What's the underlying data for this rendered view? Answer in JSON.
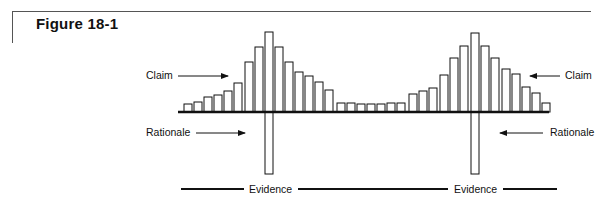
{
  "figure": {
    "title": "Figure 18-1"
  },
  "labels": {
    "claim_left": "Claim",
    "claim_right": "Claim",
    "rationale_left": "Rationale",
    "rationale_right": "Rationale",
    "evidence_left": "Evidence",
    "evidence_right": "Evidence"
  },
  "colors": {
    "stroke": "#111111",
    "frame": "#555555",
    "background": "#ffffff"
  },
  "diagram": {
    "baseline_y": 112,
    "bar_width": 8,
    "claim_bars": [
      {
        "x": 184,
        "top": 104
      },
      {
        "x": 194,
        "top": 102
      },
      {
        "x": 204,
        "top": 97
      },
      {
        "x": 214,
        "top": 95
      },
      {
        "x": 224,
        "top": 91
      },
      {
        "x": 234,
        "top": 83
      },
      {
        "x": 245,
        "top": 62
      },
      {
        "x": 255,
        "top": 47
      },
      {
        "x": 265,
        "top": 32
      },
      {
        "x": 275,
        "top": 47
      },
      {
        "x": 285,
        "top": 62
      },
      {
        "x": 295,
        "top": 72
      },
      {
        "x": 305,
        "top": 76
      },
      {
        "x": 315,
        "top": 82
      },
      {
        "x": 325,
        "top": 90
      },
      {
        "x": 337,
        "top": 103
      },
      {
        "x": 347,
        "top": 103
      },
      {
        "x": 357,
        "top": 104
      },
      {
        "x": 367,
        "top": 104
      },
      {
        "x": 377,
        "top": 104
      },
      {
        "x": 387,
        "top": 103
      },
      {
        "x": 397,
        "top": 103
      },
      {
        "x": 409,
        "top": 94
      },
      {
        "x": 419,
        "top": 91
      },
      {
        "x": 429,
        "top": 88
      },
      {
        "x": 440,
        "top": 75
      },
      {
        "x": 450,
        "top": 58
      },
      {
        "x": 460,
        "top": 46
      },
      {
        "x": 471,
        "top": 33
      },
      {
        "x": 481,
        "top": 46
      },
      {
        "x": 491,
        "top": 58
      },
      {
        "x": 502,
        "top": 69
      },
      {
        "x": 512,
        "top": 74
      },
      {
        "x": 522,
        "top": 87
      },
      {
        "x": 532,
        "top": 93
      },
      {
        "x": 542,
        "top": 103
      }
    ],
    "rationale_bars": [
      {
        "x": 265,
        "bottom": 174
      },
      {
        "x": 471,
        "bottom": 174
      }
    ]
  }
}
